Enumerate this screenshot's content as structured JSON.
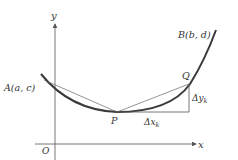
{
  "diagram": {
    "axes": {
      "x_label": "x",
      "y_label": "y",
      "origin_label": "O"
    },
    "points": {
      "A": "A(a, c)",
      "B": "B(b, d)",
      "P": "P",
      "Q": "Q"
    },
    "increments": {
      "dx": "Δx",
      "dx_sub": "k",
      "dy": "Δy",
      "dy_sub": "k"
    },
    "colors": {
      "curve": "#3a3a3a",
      "axes": "#555555",
      "chord": "#666666",
      "text": "#333333"
    }
  }
}
